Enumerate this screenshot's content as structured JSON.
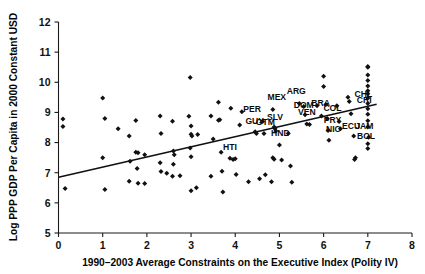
{
  "figure": {
    "title": "",
    "background": "#ffffff",
    "foreground": "#111111"
  },
  "chart_data": {
    "type": "scatter",
    "title": "",
    "xlabel": "1990–2003 Average Constraints on the Executive Index (Polity IV)",
    "ylabel": "Log PPP GDP Per Capita in 2000 Constant USD",
    "xlim": [
      0,
      8
    ],
    "ylim": [
      5,
      12
    ],
    "xticks": [
      0,
      1,
      2,
      3,
      4,
      5,
      6,
      7,
      8
    ],
    "xtick_labels": [
      "0",
      "1",
      "2",
      "3",
      "4",
      "5",
      "6",
      "7",
      "8"
    ],
    "yticks": [
      5,
      6,
      7,
      8,
      9,
      10,
      11,
      12
    ],
    "ytick_labels": [
      "5",
      "6",
      "7",
      "8",
      "9",
      "10",
      "11",
      "12"
    ],
    "grid": false,
    "legend": null,
    "marker": "diamond",
    "marker_color": "#111111",
    "trendline": {
      "x": [
        0.0,
        7.2
      ],
      "y": [
        6.85,
        9.27
      ],
      "color": "#111111",
      "style": "solid"
    },
    "points": [
      {
        "x": 0.1,
        "y": 8.78
      },
      {
        "x": 0.1,
        "y": 8.53
      },
      {
        "x": 0.15,
        "y": 6.48
      },
      {
        "x": 1.0,
        "y": 9.48
      },
      {
        "x": 1.05,
        "y": 8.8
      },
      {
        "x": 1.0,
        "y": 7.5
      },
      {
        "x": 1.05,
        "y": 6.44
      },
      {
        "x": 1.35,
        "y": 8.46
      },
      {
        "x": 1.6,
        "y": 8.22
      },
      {
        "x": 1.62,
        "y": 7.38
      },
      {
        "x": 1.6,
        "y": 6.72
      },
      {
        "x": 1.75,
        "y": 8.73
      },
      {
        "x": 1.75,
        "y": 7.68
      },
      {
        "x": 1.8,
        "y": 7.66
      },
      {
        "x": 1.78,
        "y": 7.14
      },
      {
        "x": 1.8,
        "y": 6.65
      },
      {
        "x": 1.95,
        "y": 7.6
      },
      {
        "x": 1.95,
        "y": 6.64
      },
      {
        "x": 2.3,
        "y": 8.88
      },
      {
        "x": 2.32,
        "y": 8.3
      },
      {
        "x": 2.3,
        "y": 7.33
      },
      {
        "x": 2.32,
        "y": 7.04
      },
      {
        "x": 2.45,
        "y": 6.98
      },
      {
        "x": 2.58,
        "y": 8.71
      },
      {
        "x": 2.6,
        "y": 7.72
      },
      {
        "x": 2.62,
        "y": 7.6
      },
      {
        "x": 2.6,
        "y": 7.28
      },
      {
        "x": 2.58,
        "y": 6.88
      },
      {
        "x": 2.75,
        "y": 6.9
      },
      {
        "x": 2.98,
        "y": 10.16
      },
      {
        "x": 2.95,
        "y": 8.87
      },
      {
        "x": 3.0,
        "y": 8.55
      },
      {
        "x": 3.0,
        "y": 8.28
      },
      {
        "x": 3.02,
        "y": 8.22
      },
      {
        "x": 2.98,
        "y": 7.82
      },
      {
        "x": 3.0,
        "y": 7.53
      },
      {
        "x": 3.0,
        "y": 6.4
      },
      {
        "x": 3.15,
        "y": 8.27
      },
      {
        "x": 3.12,
        "y": 6.5
      },
      {
        "x": 3.45,
        "y": 8.88
      },
      {
        "x": 3.5,
        "y": 8.12
      },
      {
        "x": 3.45,
        "y": 6.88
      },
      {
        "x": 3.62,
        "y": 9.34
      },
      {
        "x": 3.65,
        "y": 8.76
      },
      {
        "x": 3.62,
        "y": 8.74
      },
      {
        "x": 3.68,
        "y": 7.68
      },
      {
        "x": 3.7,
        "y": 7.05
      },
      {
        "x": 3.72,
        "y": 6.36
      },
      {
        "x": 3.9,
        "y": 9.14
      },
      {
        "x": 3.88,
        "y": 7.48
      },
      {
        "x": 3.95,
        "y": 7.44
      },
      {
        "x": 4.0,
        "y": 7.46
      },
      {
        "x": 4.02,
        "y": 6.94
      },
      {
        "x": 4.1,
        "y": 8.58
      },
      {
        "x": 4.15,
        "y": 9.02
      },
      {
        "x": 4.3,
        "y": 6.7
      },
      {
        "x": 4.45,
        "y": 8.36
      },
      {
        "x": 4.48,
        "y": 8.3
      },
      {
        "x": 4.55,
        "y": 6.8
      },
      {
        "x": 4.62,
        "y": 8.7
      },
      {
        "x": 4.65,
        "y": 8.3
      },
      {
        "x": 4.68,
        "y": 6.93
      },
      {
        "x": 4.85,
        "y": 9.1
      },
      {
        "x": 4.88,
        "y": 8.52
      },
      {
        "x": 4.9,
        "y": 8.46
      },
      {
        "x": 4.92,
        "y": 8.38
      },
      {
        "x": 4.85,
        "y": 7.5
      },
      {
        "x": 4.88,
        "y": 7.45
      },
      {
        "x": 4.82,
        "y": 6.7
      },
      {
        "x": 5.0,
        "y": 7.92
      },
      {
        "x": 5.05,
        "y": 7.42
      },
      {
        "x": 5.2,
        "y": 8.3
      },
      {
        "x": 5.25,
        "y": 7.22
      },
      {
        "x": 5.28,
        "y": 6.68
      },
      {
        "x": 5.45,
        "y": 9.3
      },
      {
        "x": 5.55,
        "y": 9.2
      },
      {
        "x": 5.58,
        "y": 8.92
      },
      {
        "x": 5.62,
        "y": 8.62
      },
      {
        "x": 5.68,
        "y": 8.6
      },
      {
        "x": 5.85,
        "y": 9.22
      },
      {
        "x": 5.95,
        "y": 8.88
      },
      {
        "x": 6.0,
        "y": 10.2
      },
      {
        "x": 6.0,
        "y": 9.86
      },
      {
        "x": 6.05,
        "y": 9.26
      },
      {
        "x": 6.08,
        "y": 8.8
      },
      {
        "x": 6.1,
        "y": 8.4
      },
      {
        "x": 6.12,
        "y": 8.08
      },
      {
        "x": 6.3,
        "y": 9.22
      },
      {
        "x": 6.35,
        "y": 8.7
      },
      {
        "x": 6.38,
        "y": 8.46
      },
      {
        "x": 6.55,
        "y": 9.5
      },
      {
        "x": 6.58,
        "y": 9.36
      },
      {
        "x": 6.62,
        "y": 8.96
      },
      {
        "x": 6.68,
        "y": 8.22
      },
      {
        "x": 6.72,
        "y": 7.5
      },
      {
        "x": 6.7,
        "y": 7.44
      },
      {
        "x": 7.0,
        "y": 10.52
      },
      {
        "x": 7.0,
        "y": 10.5
      },
      {
        "x": 7.0,
        "y": 10.24
      },
      {
        "x": 7.0,
        "y": 10.06
      },
      {
        "x": 7.0,
        "y": 9.88
      },
      {
        "x": 7.0,
        "y": 9.72
      },
      {
        "x": 7.0,
        "y": 9.62
      },
      {
        "x": 7.0,
        "y": 9.48
      },
      {
        "x": 7.0,
        "y": 9.3
      },
      {
        "x": 7.0,
        "y": 9.12
      },
      {
        "x": 7.0,
        "y": 8.94
      },
      {
        "x": 7.0,
        "y": 8.72
      },
      {
        "x": 7.0,
        "y": 8.52
      },
      {
        "x": 7.02,
        "y": 8.18
      },
      {
        "x": 7.0,
        "y": 7.96
      },
      {
        "x": 7.0,
        "y": 7.8
      }
    ],
    "annotations": [
      {
        "text": "MEX",
        "x": 4.94,
        "y": 9.42
      },
      {
        "text": "ARG",
        "x": 5.38,
        "y": 9.62
      },
      {
        "text": "DOM",
        "x": 5.55,
        "y": 9.14
      },
      {
        "text": "BRA",
        "x": 5.93,
        "y": 9.22
      },
      {
        "text": "COL",
        "x": 6.2,
        "y": 9.04
      },
      {
        "text": "VEN",
        "x": 5.62,
        "y": 8.92
      },
      {
        "text": "PRY",
        "x": 6.2,
        "y": 8.66
      },
      {
        "text": "CHL",
        "x": 6.9,
        "y": 9.52
      },
      {
        "text": "CRI",
        "x": 6.92,
        "y": 9.32
      },
      {
        "text": "NIC",
        "x": 6.22,
        "y": 8.36
      },
      {
        "text": "ECU",
        "x": 6.62,
        "y": 8.46
      },
      {
        "text": "JAM",
        "x": 6.92,
        "y": 8.46
      },
      {
        "text": "BOL",
        "x": 6.96,
        "y": 8.12
      },
      {
        "text": "PER",
        "x": 4.38,
        "y": 9.02
      },
      {
        "text": "SLV",
        "x": 4.9,
        "y": 8.74
      },
      {
        "text": "GUY",
        "x": 4.44,
        "y": 8.6
      },
      {
        "text": "GTM",
        "x": 4.68,
        "y": 8.58
      },
      {
        "text": "HND",
        "x": 5.02,
        "y": 8.22
      },
      {
        "text": "HTI",
        "x": 3.88,
        "y": 7.76
      }
    ]
  }
}
